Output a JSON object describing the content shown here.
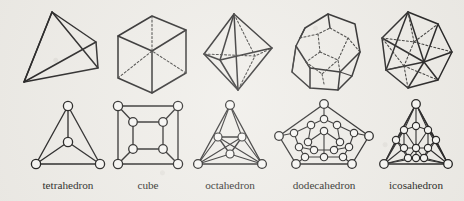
{
  "figure": {
    "background_color": "#eeece7",
    "ink_color": "#242323",
    "node_fill_color": "#f7f6f3",
    "rows": [
      {
        "name": "solids-row",
        "description": "three-dimensional line drawings of the regular polyhedra with dashed hidden edges"
      },
      {
        "name": "graphs-row",
        "description": "planar graph (Schlegel) diagrams of the regular polyhedra with circular vertices"
      }
    ],
    "columns": [
      {
        "id": "tetrahedron",
        "label": "tetrahedron",
        "label_x": 68,
        "vertices": 4,
        "edges": 6,
        "faces": 4,
        "face_shape": "triangle"
      },
      {
        "id": "cube",
        "label": "cube",
        "label_x": 148,
        "vertices": 8,
        "edges": 12,
        "faces": 6,
        "face_shape": "square"
      },
      {
        "id": "octahedron",
        "label": "octahedron",
        "label_x": 230,
        "vertices": 6,
        "edges": 12,
        "faces": 8,
        "face_shape": "triangle"
      },
      {
        "id": "dodecahedron",
        "label": "dodecahedron",
        "label_x": 324,
        "vertices": 20,
        "edges": 30,
        "faces": 12,
        "face_shape": "pentagon"
      },
      {
        "id": "icosahedron",
        "label": "icosahedron",
        "label_x": 416,
        "vertices": 12,
        "edges": 30,
        "faces": 20,
        "face_shape": "triangle"
      }
    ]
  }
}
